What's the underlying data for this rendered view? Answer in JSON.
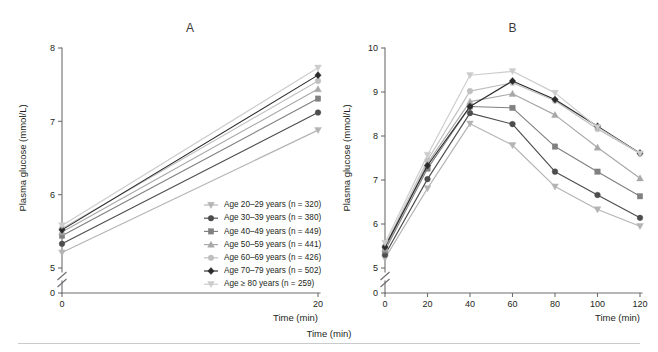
{
  "figure": {
    "width": 658,
    "height": 352,
    "background": "#ffffff",
    "rule_color": "#c9cacc"
  },
  "panels": [
    {
      "id": "A",
      "label": "A"
    },
    {
      "id": "B",
      "label": "B"
    }
  ],
  "axis_titles": {
    "y": "Plasma glucose (mmol/L)",
    "x": "Time (min)"
  },
  "legend": {
    "position": "inside-panel-a-lower-right",
    "items": [
      {
        "label": "Age 20–29 years (n = 320)",
        "color": "#b4b4b4",
        "marker": "triangle-down",
        "n": 320,
        "age_group": "20–29"
      },
      {
        "label": "Age 30–39 years (n = 380)",
        "color": "#4d4d4d",
        "marker": "circle",
        "n": 380,
        "age_group": "30–39"
      },
      {
        "label": "Age 40–49 years (n = 449)",
        "color": "#808080",
        "marker": "square",
        "n": 449,
        "age_group": "40–49"
      },
      {
        "label": "Age 50–59 years (n = 441)",
        "color": "#a8a8a8",
        "marker": "triangle-up",
        "n": 441,
        "age_group": "50–59"
      },
      {
        "label": "Age 60–69 years (n = 426)",
        "color": "#bfbfbf",
        "marker": "circle",
        "n": 426,
        "age_group": "60–69"
      },
      {
        "label": "Age 70–79 years (n = 502)",
        "color": "#2b2b2b",
        "marker": "diamond",
        "n": 502,
        "age_group": "70–79"
      },
      {
        "label": "Age ≥ 80 years (n = 259)",
        "color": "#cccccc",
        "marker": "triangle-down",
        "n": 259,
        "age_group": "≥ 80"
      }
    ]
  },
  "chart_data": [
    {
      "type": "line",
      "panel": "A",
      "title": "A",
      "xlabel": "Time (min)",
      "ylabel": "Plasma glucose (mmol/L)",
      "x": [
        0,
        20
      ],
      "xlim": [
        0,
        20
      ],
      "xticks": [
        0,
        20
      ],
      "xticklabels": [
        "0",
        "20"
      ],
      "ylim": [
        5.0,
        8.0
      ],
      "yticks": [
        5,
        6,
        7,
        8
      ],
      "yticklabels": [
        "5",
        "6",
        "7",
        "8"
      ],
      "y_break": {
        "enabled": true,
        "zero_label": "0"
      },
      "grid": false,
      "legend_position": "lower right",
      "series": [
        {
          "name": "Age 20–29 years (n = 320)",
          "color": "#b4b4b4",
          "marker": "triangle-down",
          "values": [
            5.21,
            6.88
          ]
        },
        {
          "name": "Age 30–39 years (n = 380)",
          "color": "#4d4d4d",
          "marker": "circle",
          "values": [
            5.33,
            7.12
          ]
        },
        {
          "name": "Age 40–49 years (n = 449)",
          "color": "#808080",
          "marker": "square",
          "values": [
            5.44,
            7.31
          ]
        },
        {
          "name": "Age 50–59 years (n = 441)",
          "color": "#a8a8a8",
          "marker": "triangle-up",
          "values": [
            5.49,
            7.44
          ]
        },
        {
          "name": "Age 60–69 years (n = 426)",
          "color": "#bfbfbf",
          "marker": "circle",
          "values": [
            5.54,
            7.55
          ]
        },
        {
          "name": "Age 70–79 years (n = 502)",
          "color": "#2b2b2b",
          "marker": "diamond",
          "values": [
            5.52,
            7.63
          ]
        },
        {
          "name": "Age ≥ 80 years (n = 259)",
          "color": "#cccccc",
          "marker": "triangle-down",
          "values": [
            5.58,
            7.73
          ]
        }
      ]
    },
    {
      "type": "line",
      "panel": "B",
      "title": "B",
      "xlabel": "Time (min)",
      "ylabel": "Plasma glucose (mmol/L)",
      "x": [
        0,
        20,
        40,
        60,
        80,
        100,
        120
      ],
      "xlim": [
        0,
        120
      ],
      "xticks": [
        0,
        20,
        40,
        60,
        80,
        100,
        120
      ],
      "xticklabels": [
        "0",
        "20",
        "40",
        "60",
        "80",
        "100",
        "120"
      ],
      "ylim": [
        5.0,
        10.0
      ],
      "yticks": [
        5,
        6,
        7,
        8,
        9,
        10
      ],
      "yticklabels": [
        "5",
        "6",
        "7",
        "8",
        "9",
        "10"
      ],
      "y_break": {
        "enabled": true,
        "zero_label": "0"
      },
      "grid": false,
      "legend_position": "shared-with-panel-a",
      "series": [
        {
          "name": "Age 20–29 years (n = 320)",
          "color": "#b4b4b4",
          "marker": "triangle-down",
          "values": [
            5.22,
            6.81,
            8.28,
            7.79,
            6.85,
            6.33,
            5.95
          ]
        },
        {
          "name": "Age 30–39 years (n = 380)",
          "color": "#4d4d4d",
          "marker": "circle",
          "values": [
            5.3,
            7.02,
            8.52,
            8.27,
            7.19,
            6.66,
            6.14
          ]
        },
        {
          "name": "Age 40–49 years (n = 449)",
          "color": "#808080",
          "marker": "square",
          "values": [
            5.4,
            7.26,
            8.67,
            8.64,
            7.76,
            7.19,
            6.63
          ]
        },
        {
          "name": "Age 50–59 years (n = 441)",
          "color": "#a8a8a8",
          "marker": "triangle-up",
          "values": [
            5.44,
            7.38,
            8.78,
            8.96,
            8.48,
            7.74,
            7.04
          ]
        },
        {
          "name": "Age 60–69 years (n = 426)",
          "color": "#bfbfbf",
          "marker": "circle",
          "values": [
            5.5,
            7.45,
            9.02,
            9.21,
            8.8,
            8.16,
            7.6
          ]
        },
        {
          "name": "Age 70–79 years (n = 502)",
          "color": "#2b2b2b",
          "marker": "diamond",
          "values": [
            5.48,
            7.33,
            8.67,
            9.25,
            8.83,
            8.22,
            7.61
          ]
        },
        {
          "name": "Age ≥ 80 years (n = 259)",
          "color": "#cccccc",
          "marker": "triangle-down",
          "values": [
            5.57,
            7.57,
            9.38,
            9.47,
            8.98,
            8.2,
            7.6
          ]
        }
      ]
    }
  ]
}
